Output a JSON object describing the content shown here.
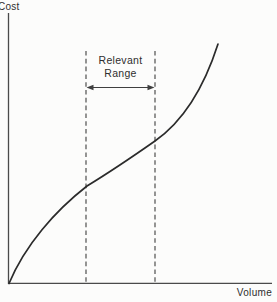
{
  "figure": {
    "y_axis_label": "Cost",
    "x_axis_label": "Volume",
    "annotation": {
      "line1": "Relevant",
      "line2": "Range"
    }
  },
  "chart_data": {
    "type": "line",
    "title": "",
    "xlabel": "Volume",
    "ylabel": "Cost",
    "axes_numeric": false,
    "grid": false,
    "legend": false,
    "series": [
      {
        "name": "Total cost curve",
        "points_norm_x_y": [
          [
            0.0,
            0.0
          ],
          [
            0.08,
            0.12
          ],
          [
            0.17,
            0.23
          ],
          [
            0.3,
            0.36
          ],
          [
            0.42,
            0.45
          ],
          [
            0.56,
            0.53
          ],
          [
            0.67,
            0.62
          ],
          [
            0.75,
            0.73
          ],
          [
            0.79,
            0.89
          ]
        ]
      }
    ],
    "annotations": [
      {
        "label": "Relevant Range",
        "x_start_norm": 0.29,
        "x_end_norm": 0.56,
        "style": "two vertical dashed lines spanning the plot with a double-headed arrow between them"
      }
    ],
    "curve_path_px": "M 9 283.5 C 25 245 55 211 87 186 C 110 172 135 155 155 141 C 175 127 200 100 218 44"
  },
  "geometry": {
    "y_axis": {
      "x1": 8.5,
      "y1": 13,
      "x2": 8.5,
      "y2": 284
    },
    "x_axis": {
      "x1": 8,
      "y1": 283.3,
      "x2": 272,
      "y2": 283.3
    },
    "dash_left": {
      "x1": 86,
      "y1": 51,
      "x2": 86,
      "y2": 283
    },
    "dash_right": {
      "x1": 155,
      "y1": 51,
      "x2": 155,
      "y2": 283
    },
    "arrow": {
      "x1": 92,
      "y1": 87.5,
      "x2": 149,
      "y2": 87.5
    },
    "arrow_left_head": "86.5,87.5 93.5,84.7 93.5,90.3",
    "arrow_right_head": "154.5,87.5 147.5,84.7 147.5,90.3"
  },
  "colors": {
    "background": "#fcfcfb",
    "curve": "#2b2b2b",
    "axis": "#4a4a4a",
    "dashed": "#3f3f3f",
    "text": "#2e2e2e"
  }
}
